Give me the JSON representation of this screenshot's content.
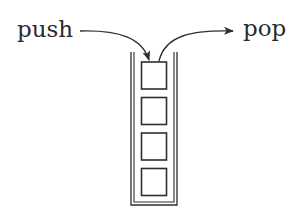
{
  "diagram": {
    "labels": {
      "push": "push",
      "pop": "pop"
    },
    "stack": {
      "item_count": 4,
      "items": [
        "",
        "",
        "",
        ""
      ]
    },
    "colors": {
      "stroke": "#2e2e2e",
      "text": "#2a2a2a",
      "background": "#ffffff"
    }
  }
}
